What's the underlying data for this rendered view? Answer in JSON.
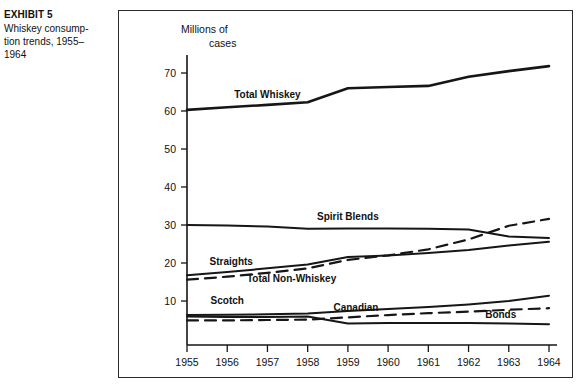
{
  "caption": {
    "exhibit_label": "EXHIBIT 5",
    "description": "Whiskey consump-\ntion trends, 1955–\n1964"
  },
  "chart_data": {
    "type": "line",
    "title": "",
    "subtitle": "",
    "xlabel": "",
    "ylabel": "Millions of cases",
    "ylabel_line1": "Millions of",
    "ylabel_line2": "cases",
    "grid": false,
    "legend": "inline-labels",
    "categories": [
      "1955",
      "1956",
      "1957",
      "1958",
      "1959",
      "1960",
      "1961",
      "1962",
      "1963",
      "1964"
    ],
    "x": [
      1955,
      1956,
      1957,
      1958,
      1959,
      1960,
      1961,
      1962,
      1963,
      1964
    ],
    "xlim": [
      1955,
      1964
    ],
    "ylim": [
      0,
      75
    ],
    "yticks": [
      10,
      20,
      30,
      40,
      50,
      60,
      70
    ],
    "ytick_labels": [
      "10",
      "20",
      "30",
      "40",
      "50",
      "60",
      "70"
    ],
    "series": [
      {
        "name": "Total Whiskey",
        "style": "solid",
        "width": 2.6,
        "label_x": 1957.0,
        "label_y": 63.5,
        "values": [
          60.3,
          61.0,
          61.6,
          62.3,
          66.0,
          66.3,
          66.6,
          69.0,
          70.5,
          71.8
        ]
      },
      {
        "name": "Spirit Blends",
        "style": "solid",
        "width": 2.0,
        "label_x": 1959.0,
        "label_y": 31.4,
        "values": [
          30.0,
          29.9,
          29.6,
          29.0,
          29.1,
          29.1,
          29.0,
          28.8,
          27.0,
          26.6
        ]
      },
      {
        "name": "Straights",
        "style": "solid",
        "width": 2.0,
        "label_x": 1956.1,
        "label_y": 19.6,
        "values": [
          16.8,
          17.6,
          18.6,
          19.6,
          21.6,
          22.0,
          22.6,
          23.4,
          24.6,
          25.6
        ]
      },
      {
        "name": "Total Non-Whiskey",
        "style": "dashed",
        "width": 2.2,
        "label_x": 1957.6,
        "label_y": 15.1,
        "values": [
          15.6,
          16.4,
          17.4,
          18.6,
          20.8,
          22.0,
          23.6,
          26.2,
          29.8,
          31.6
        ]
      },
      {
        "name": "Scotch",
        "style": "solid",
        "width": 2.0,
        "label_x": 1956.0,
        "label_y": 9.2,
        "values": [
          6.3,
          6.4,
          6.5,
          6.7,
          7.4,
          7.9,
          8.4,
          9.1,
          10.0,
          11.4
        ]
      },
      {
        "name": "Canadian",
        "style": "dashed",
        "width": 2.2,
        "label_x": 1959.2,
        "label_y": 7.3,
        "values": [
          4.9,
          4.9,
          5.0,
          5.1,
          5.7,
          6.3,
          6.8,
          7.2,
          7.7,
          8.1
        ]
      },
      {
        "name": "Bonds",
        "style": "solid",
        "width": 2.0,
        "label_x": 1962.8,
        "label_y": 5.5,
        "values": [
          5.9,
          5.8,
          5.8,
          5.9,
          4.1,
          4.2,
          4.2,
          4.2,
          4.1,
          3.9
        ]
      }
    ]
  }
}
